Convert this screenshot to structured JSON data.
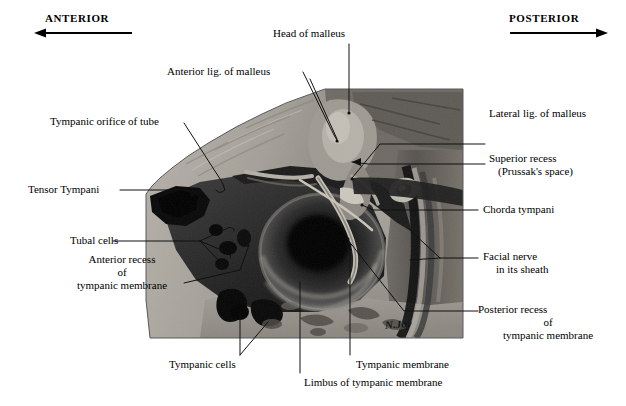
{
  "figure": {
    "kind": "anatomical-photograph",
    "signature": "N.Joy",
    "orientation": {
      "left_label": "ANTERIOR",
      "right_label": "POSTERIOR",
      "left_arrow_icon": "arrow-left-icon",
      "right_arrow_icon": "arrow-right-icon"
    },
    "labels": [
      {
        "id": "head-of-malleus",
        "text": "Head of malleus"
      },
      {
        "id": "anterior-lig-of-malleus",
        "text": "Anterior lig. of malleus"
      },
      {
        "id": "tympanic-orifice-of-tube",
        "text": "Tympanic orifice of tube"
      },
      {
        "id": "tensor-tympani",
        "text": "Tensor Tympani"
      },
      {
        "id": "tubal-cells",
        "text": "Tubal cells"
      },
      {
        "id": "anterior-recess",
        "text": "Anterior recess",
        "line2": "of",
        "line3": "tympanic membrane"
      },
      {
        "id": "tympanic-cells",
        "text": "Tympanic cells"
      },
      {
        "id": "limbus-of-tympanic-membrane",
        "text": "Limbus of tympanic membrane"
      },
      {
        "id": "tympanic-membrane",
        "text": "Tympanic membrane"
      },
      {
        "id": "lateral-lig-of-malleus",
        "text": "Lateral lig. of malleus"
      },
      {
        "id": "superior-recess",
        "text": "Superior recess",
        "line2": "(Prussak's space)"
      },
      {
        "id": "chorda-tympani",
        "text": "Chorda tympani"
      },
      {
        "id": "facial-nerve",
        "text": "Facial nerve",
        "line2": "in its sheath"
      },
      {
        "id": "posterior-recess",
        "text": "Posterior recess",
        "line2": "of",
        "line3": "tympanic membrane"
      }
    ]
  }
}
